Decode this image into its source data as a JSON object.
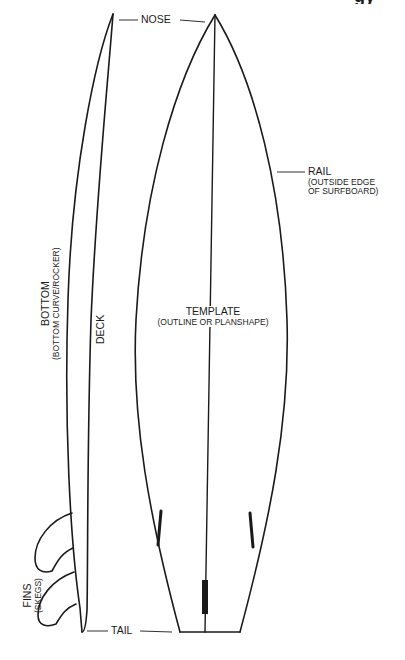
{
  "title": {
    "visible_fragment": "gy",
    "note": "heading clipped at top edge"
  },
  "labels": {
    "nose": "NOSE",
    "rail": {
      "main": "RAIL",
      "sub_line1": "(OUTSIDE EDGE",
      "sub_line2": "OF SURFBOARD)"
    },
    "template": {
      "main": "TEMPLATE",
      "sub": "(OUTLINE OR PLANSHAPE)"
    },
    "bottom": {
      "main": "BOTTOM",
      "sub": "(BOTTOM CURVE/ROCKER)"
    },
    "deck": "DECK",
    "fins": {
      "main": "FINS",
      "sub": "(SKEGS)"
    },
    "tail": "TAIL"
  },
  "colors": {
    "line": "#1a1a1a",
    "background": "#ffffff"
  }
}
